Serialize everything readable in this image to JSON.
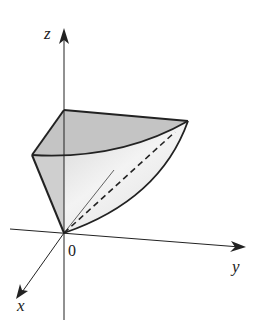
{
  "figure": {
    "type": "3d-solid-diagram",
    "axes": {
      "x_label": "x",
      "y_label": "y",
      "z_label": "z",
      "origin_label": "0"
    },
    "colors": {
      "line": "#222222",
      "fill_top": "#bdbdbd",
      "fill_side": "#d6d6d6",
      "fill_light": "#ececec"
    }
  }
}
